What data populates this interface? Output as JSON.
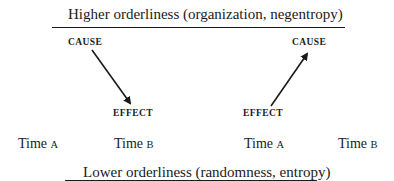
{
  "top_heading": {
    "text": "Higher orderliness (organization, negentropy)"
  },
  "bottom_heading": {
    "text": "Lower orderliness (randomness, entropy)"
  },
  "left_panel": {
    "cause_label": "CAUSE",
    "effect_label": "EFFECT",
    "arrow_direction": "cause-to-effect (downward)",
    "time_a": {
      "prefix": "Time",
      "letter": "A"
    },
    "time_b": {
      "prefix": "Time",
      "letter": "B"
    }
  },
  "right_panel": {
    "cause_label": "CAUSE",
    "effect_label": "EFFECT",
    "arrow_direction": "effect-to-cause (upward)",
    "time_a": {
      "prefix": "Time",
      "letter": "A"
    },
    "time_b": {
      "prefix": "Time",
      "letter": "B"
    }
  },
  "colors": {
    "ink": "#1a1a1a",
    "background": "#ffffff"
  }
}
